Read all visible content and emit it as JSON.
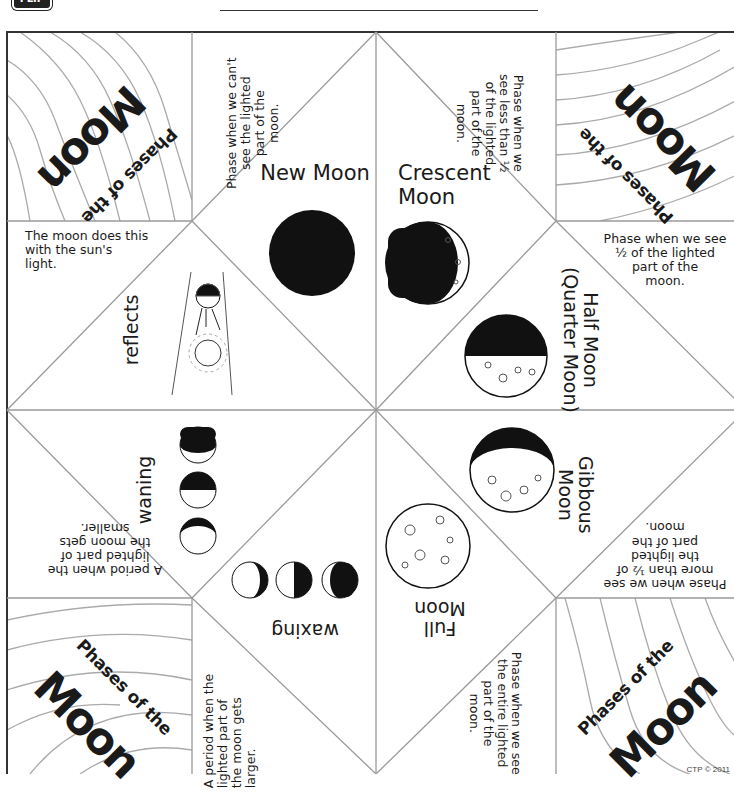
{
  "header": {
    "logo_text": "FLIP",
    "answer_blanks": 5
  },
  "corners": {
    "top_left": {
      "line1": "Phases of the",
      "line2": "Moon"
    },
    "top_right": {
      "line1": "Phases of the",
      "line2": "Moon"
    },
    "bottom_left": {
      "line1": "Phases of the",
      "line2": "Moon"
    },
    "bottom_right": {
      "line1": "Phases of the",
      "line2": "Moon"
    }
  },
  "definitions": {
    "new_moon": "Phase when we can't\nsee the lighted\npart of the\nmoon.",
    "crescent": "Phase when we\nsee less than ½\nof the lighted\npart of the\nmoon.",
    "reflects": "The moon does this\nwith the sun's\nlight.",
    "half_moon": "Phase when we see\n½ of the lighted\npart of the\nmoon.",
    "waning": "A period when the\nlighted part of\nthe moon gets\nsmaller.",
    "gibbous": "Phase when we see\nmore than ½ of\nthe lighted\npart of the\nmoon.",
    "waxing": "A period when the\nlighted part of\nthe moon gets\nlarger.",
    "full_moon": "Phase when we see\nthe entire lighted\npart of the\nmoon."
  },
  "terms": {
    "new_moon": "New Moon",
    "crescent": "Crescent\nMoon",
    "reflects": "reflects",
    "half_moon": "Half Moon\n(Quarter Moon)",
    "waning": "waning",
    "gibbous": "Gibbous\nMoon",
    "waxing": "waxing",
    "full_moon": "Full\nMoon"
  },
  "footer": {
    "copyright": "CTP © 2011"
  },
  "colors": {
    "line": "#9a9a9a",
    "border": "#333333",
    "ink": "#111111"
  }
}
